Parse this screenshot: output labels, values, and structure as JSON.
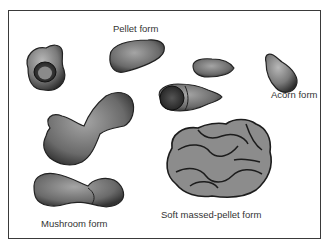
{
  "figure": {
    "labels": {
      "pellet": "Pellet form",
      "acorn": "Acorn form",
      "mushroom": "Mushroom form",
      "soft_massed_pellet": "Soft massed-pellet form"
    },
    "shapes": [
      {
        "name": "cupped-pellet",
        "category": "pellet"
      },
      {
        "name": "elongated-pellet",
        "category": "pellet"
      },
      {
        "name": "small-pellet",
        "category": "pellet"
      },
      {
        "name": "segmented-pellet",
        "category": "pellet"
      },
      {
        "name": "acorn-pellet",
        "category": "acorn"
      },
      {
        "name": "mushroom-pellet-upper",
        "category": "mushroom"
      },
      {
        "name": "mushroom-pellet-lower",
        "category": "mushroom"
      },
      {
        "name": "soft-massed-pellet",
        "category": "soft massed-pellet"
      }
    ],
    "colors": {
      "frame": "#3a3a3a",
      "shape_fill": "#8a8a8a",
      "shape_dark": "#2e2e2e",
      "label": "#333333"
    }
  }
}
